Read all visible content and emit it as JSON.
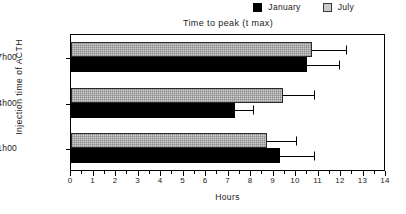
{
  "chart_data": {
    "type": "bar",
    "orientation": "horizontal",
    "title": "Time to peak (t max)",
    "xlabel": "Hours",
    "ylabel": "Injection time of ACTH",
    "xlim": [
      0,
      14
    ],
    "xticks": [
      0,
      1,
      2,
      3,
      4,
      5,
      6,
      7,
      8,
      9,
      10,
      11,
      12,
      13,
      14
    ],
    "categories": [
      "07h00",
      "14h00",
      "21h00"
    ],
    "grid": false,
    "legend_position": "top-right",
    "series": [
      {
        "name": "January",
        "color": "#000000",
        "values": [
          10.5,
          7.3,
          9.3
        ],
        "errors_upper": [
          1.4,
          0.8,
          1.5
        ]
      },
      {
        "name": "July",
        "color": "#d0d0d0",
        "values": [
          10.7,
          9.4,
          8.7
        ],
        "errors_upper": [
          1.5,
          1.4,
          1.3
        ]
      }
    ]
  },
  "legend": {
    "entries": [
      {
        "label": "January",
        "swatch": "black-square-icon"
      },
      {
        "label": "July",
        "swatch": "gray-square-icon"
      }
    ]
  },
  "axes": {
    "x_title": "Hours",
    "y_title": "Injection time of ACTH",
    "x_tick_labels": [
      "0",
      "1",
      "2",
      "3",
      "4",
      "5",
      "6",
      "7",
      "8",
      "9",
      "10",
      "11",
      "12",
      "13",
      "14"
    ],
    "y_tick_labels": [
      "07h00",
      "14h00",
      "21h00"
    ]
  },
  "title": "Time to peak (t max)"
}
